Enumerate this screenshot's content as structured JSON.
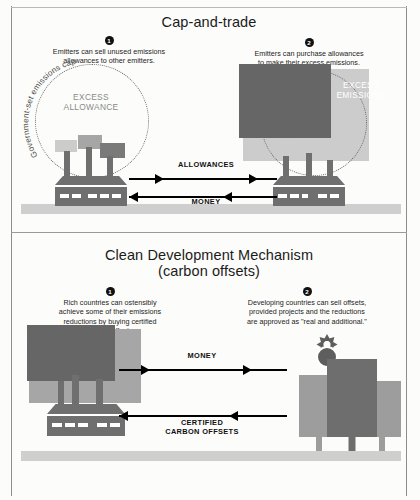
{
  "document": {
    "kind": "infographic-diagram",
    "panels": 2
  },
  "colors": {
    "ink": "#111111",
    "factory_gray": "#6f6f6f",
    "ground_gray": "#cfcfcf",
    "smoke_light": "#cccccc",
    "smoke_mid": "#a6a6a6",
    "smoke_dark": "#7a7a7a",
    "smoke_xdark": "#666666",
    "tree_light": "#9d9d9d",
    "tree_dark": "#6e6e6e",
    "label_gray": "#8a8a8a",
    "background": "#fcfcfa"
  },
  "top_panel": {
    "title": "Cap-and-trade",
    "callouts": [
      {
        "number": "1",
        "line1": "Emitters can sell unused emissions",
        "line2": "allowances to other emitters."
      },
      {
        "number": "2",
        "line1": "Emitters can purchase allowances",
        "line2": "to make their excess emissions."
      }
    ],
    "cap_circle_label": "Government-set emissions cap",
    "left_inner_label": {
      "line1": "EXCESS",
      "line2": "ALLOWANCE"
    },
    "right_inner_label": {
      "line1": "EXCESS",
      "line2": "EMISSIONS"
    },
    "arrows": [
      {
        "label": "ALLOWANCES",
        "direction": "right"
      },
      {
        "label": "MONEY",
        "direction": "left"
      }
    ]
  },
  "bottom_panel": {
    "title_line1": "Clean Development Mechanism",
    "title_line2": "(carbon offsets)",
    "callouts": [
      {
        "number": "1",
        "line1": "Rich countries can ostensibly",
        "line2": "achieve some of their emissions",
        "line3": "reductions by buying certified",
        "line4": "carbon offsets"
      },
      {
        "number": "2",
        "line1": "Developing countries can sell offsets,",
        "line2": "provided projects and the reductions",
        "line3": "are approved as \"real and additional.\""
      }
    ],
    "arrows": [
      {
        "label": "MONEY",
        "direction": "right"
      },
      {
        "label_line1": "CERTIFIED",
        "label_line2": "CARBON OFFSETS",
        "direction": "left"
      }
    ]
  },
  "icons": {
    "factory": "factory-icon",
    "smokestack": "smokestack-icon",
    "smoke_cloud": "smoke-cloud-icon",
    "tree": "tree-icon",
    "sun": "sun-icon",
    "arrow_right": "arrow-right-icon",
    "arrow_left": "arrow-left-icon"
  }
}
